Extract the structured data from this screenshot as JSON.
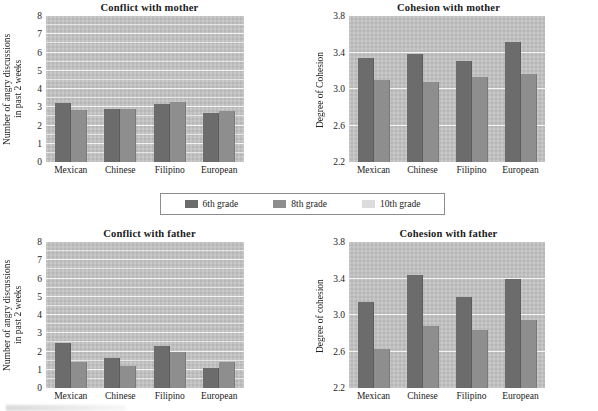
{
  "legend": {
    "items": [
      {
        "label": "6th grade",
        "color": "#6c6c6c",
        "key": "g6"
      },
      {
        "label": "8th grade",
        "color": "#8e8e8e",
        "key": "g8"
      },
      {
        "label": "10th grade",
        "color": "#dcdcdc",
        "key": "g10"
      }
    ]
  },
  "chart_data": [
    {
      "type": "bar",
      "panel": "top-left",
      "title": "Conflict with mother",
      "xlabel": "",
      "ylabel": "Number of angry discussions\nin past 2 weeks",
      "categories": [
        "Mexican",
        "Chinese",
        "Filipino",
        "European"
      ],
      "ylim": [
        0,
        8
      ],
      "yticks": [
        0,
        1,
        2,
        3,
        4,
        5,
        6,
        7,
        8
      ],
      "ytick_labels": [
        "0",
        "1",
        "2",
        "3",
        "4",
        "5",
        "6",
        "7",
        "8"
      ],
      "grid": true,
      "legend_position": "below-center-shared",
      "series": [
        {
          "name": "6th grade",
          "values": [
            3.25,
            2.9,
            3.2,
            2.7
          ]
        },
        {
          "name": "8th grade",
          "values": [
            2.85,
            2.9,
            3.3,
            2.8
          ]
        }
      ]
    },
    {
      "type": "bar",
      "panel": "top-right",
      "title": "Cohesion with mother",
      "xlabel": "",
      "ylabel": "Degree of Cohesion",
      "categories": [
        "Mexican",
        "Chinese",
        "Filipino",
        "European"
      ],
      "ylim": [
        2.2,
        3.8
      ],
      "yticks": [
        2.2,
        2.6,
        3.0,
        3.4,
        3.8
      ],
      "ytick_labels": [
        "2.2",
        "2.6",
        "3.0",
        "3.4",
        "3.8"
      ],
      "grid": true,
      "legend_position": "above-center-shared",
      "series": [
        {
          "name": "6th grade",
          "values": [
            3.34,
            3.38,
            3.31,
            3.52
          ]
        },
        {
          "name": "8th grade",
          "values": [
            3.1,
            3.08,
            3.13,
            3.17
          ]
        }
      ]
    },
    {
      "type": "bar",
      "panel": "bottom-left",
      "title": "Conflict with father",
      "xlabel": "",
      "ylabel": "Number of angry discussions\nin past 2 weeks",
      "categories": [
        "Mexican",
        "Chinese",
        "Filipino",
        "European"
      ],
      "ylim": [
        0,
        8
      ],
      "yticks": [
        0,
        1,
        2,
        3,
        4,
        5,
        6,
        7,
        8
      ],
      "ytick_labels": [
        "0",
        "1",
        "2",
        "3",
        "4",
        "5",
        "6",
        "7",
        "8"
      ],
      "grid": true,
      "legend_position": "above-center-shared",
      "series": [
        {
          "name": "6th grade",
          "values": [
            2.45,
            1.65,
            2.3,
            1.1
          ]
        },
        {
          "name": "8th grade",
          "values": [
            1.4,
            1.2,
            2.0,
            1.45
          ]
        }
      ]
    },
    {
      "type": "bar",
      "panel": "bottom-right",
      "title": "Cohesion with father",
      "xlabel": "",
      "ylabel": "Degree of cohesion",
      "categories": [
        "Mexican",
        "Chinese",
        "Filipino",
        "European"
      ],
      "ylim": [
        2.2,
        3.8
      ],
      "yticks": [
        2.2,
        2.6,
        3.0,
        3.4,
        3.8
      ],
      "ytick_labels": [
        "2.2",
        "2.6",
        "3.0",
        "3.4",
        "3.8"
      ],
      "grid": true,
      "legend_position": "above-center-shared",
      "series": [
        {
          "name": "6th grade",
          "values": [
            3.14,
            3.44,
            3.2,
            3.4
          ]
        },
        {
          "name": "8th grade",
          "values": [
            2.63,
            2.88,
            2.84,
            2.94
          ]
        }
      ]
    }
  ]
}
